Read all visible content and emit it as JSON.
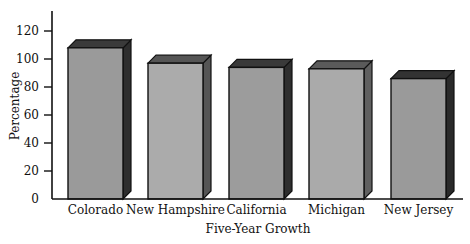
{
  "chart_data": {
    "type": "bar",
    "style": "3d",
    "title": "",
    "xlabel": "Five-Year Growth",
    "ylabel": "Percentage",
    "categories": [
      "Colorado",
      "New Hampshire",
      "California",
      "Michigan",
      "New Jersey"
    ],
    "values": [
      108,
      97,
      94,
      93,
      86
    ],
    "ylim": [
      0,
      130
    ],
    "yticks": [
      0,
      20,
      40,
      60,
      80,
      100,
      120
    ],
    "grid": false,
    "legend": null,
    "bar_colors": [
      {
        "front": "#9a9a9a",
        "top": "#3a3a3a",
        "side": "#2e2e2e"
      },
      {
        "front": "#ababab",
        "top": "#555555",
        "side": "#555555"
      },
      {
        "front": "#9c9c9c",
        "top": "#3a3a3a",
        "side": "#2e2e2e"
      },
      {
        "front": "#aaaaaa",
        "top": "#5a5a5a",
        "side": "#606060"
      },
      {
        "front": "#9a9a9a",
        "top": "#333333",
        "side": "#2a2a2a"
      }
    ]
  }
}
